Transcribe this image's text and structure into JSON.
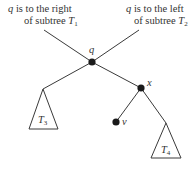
{
  "diagram": {
    "colors": {
      "stroke": "#3a3a3a",
      "node": "#1a1a1a",
      "text": "#333333",
      "background": "#ffffff"
    },
    "annotations": {
      "left": {
        "var": "q",
        "line1_rest": " is to the right",
        "line2_prefix": "of subtree ",
        "subtree": "T",
        "subtree_index": "1"
      },
      "right": {
        "var": "q",
        "line1_rest": " is to the left",
        "line2_prefix": "of subtree ",
        "subtree": "T",
        "subtree_index": "2"
      }
    },
    "nodes": [
      {
        "id": "q",
        "label": "q"
      },
      {
        "id": "x",
        "label": "x"
      },
      {
        "id": "v",
        "label": "v"
      }
    ],
    "subtrees": [
      {
        "id": "T3",
        "name": "T",
        "index": "3"
      },
      {
        "id": "T4",
        "name": "T",
        "index": "4"
      }
    ]
  }
}
